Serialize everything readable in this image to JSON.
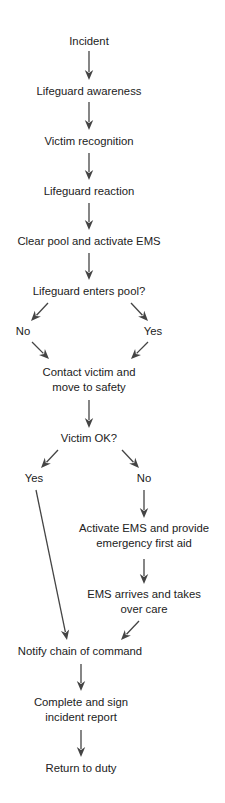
{
  "diagram": {
    "type": "flowchart",
    "colors": {
      "text": "#222222",
      "arrow": "#444444",
      "background": "#ffffff"
    },
    "nodes": [
      {
        "id": "incident",
        "lines": [
          "Incident"
        ],
        "x": 89,
        "y": 41
      },
      {
        "id": "awareness",
        "lines": [
          "Lifeguard awareness"
        ],
        "x": 89,
        "y": 91
      },
      {
        "id": "recognition",
        "lines": [
          "Victim recognition"
        ],
        "x": 89,
        "y": 141
      },
      {
        "id": "reaction",
        "lines": [
          "Lifeguard reaction"
        ],
        "x": 89,
        "y": 191
      },
      {
        "id": "clear_pool",
        "lines": [
          "Clear pool and activate EMS"
        ],
        "x": 89,
        "y": 241
      },
      {
        "id": "enters_pool",
        "lines": [
          "Lifeguard enters pool?"
        ],
        "x": 89,
        "y": 291
      },
      {
        "id": "enters_no",
        "lines": [
          "No"
        ],
        "x": 23,
        "y": 331
      },
      {
        "id": "enters_yes",
        "lines": [
          "Yes"
        ],
        "x": 153,
        "y": 331
      },
      {
        "id": "contact_victim",
        "lines": [
          "Contact victim and",
          "move to safety"
        ],
        "x": 89,
        "y": 379
      },
      {
        "id": "victim_ok",
        "lines": [
          "Victim OK?"
        ],
        "x": 89,
        "y": 438
      },
      {
        "id": "ok_yes",
        "lines": [
          "Yes"
        ],
        "x": 34,
        "y": 478
      },
      {
        "id": "ok_no",
        "lines": [
          "No"
        ],
        "x": 144,
        "y": 478
      },
      {
        "id": "activate_ems",
        "lines": [
          "Activate EMS and provide",
          "emergency first aid"
        ],
        "x": 144,
        "y": 535
      },
      {
        "id": "ems_arrives",
        "lines": [
          "EMS arrives and takes",
          "over care"
        ],
        "x": 144,
        "y": 601
      },
      {
        "id": "notify",
        "lines": [
          "Notify chain of command"
        ],
        "x": 80,
        "y": 651
      },
      {
        "id": "report",
        "lines": [
          "Complete and sign",
          "incident report"
        ],
        "x": 81,
        "y": 709
      },
      {
        "id": "return",
        "lines": [
          "Return to duty"
        ],
        "x": 81,
        "y": 768
      }
    ],
    "edges": [
      {
        "from": "incident",
        "to": "awareness",
        "x1": 89,
        "y1": 51,
        "x2": 89,
        "y2": 80
      },
      {
        "from": "awareness",
        "to": "recognition",
        "x1": 89,
        "y1": 102,
        "x2": 89,
        "y2": 130
      },
      {
        "from": "recognition",
        "to": "reaction",
        "x1": 89,
        "y1": 153,
        "x2": 89,
        "y2": 180
      },
      {
        "from": "reaction",
        "to": "clear_pool",
        "x1": 89,
        "y1": 203,
        "x2": 89,
        "y2": 230
      },
      {
        "from": "clear_pool",
        "to": "enters_pool",
        "x1": 89,
        "y1": 253,
        "x2": 89,
        "y2": 280
      },
      {
        "from": "enters_pool",
        "to": "enters_no",
        "x1": 48,
        "y1": 303,
        "x2": 31,
        "y2": 321
      },
      {
        "from": "enters_pool",
        "to": "enters_yes",
        "x1": 131,
        "y1": 303,
        "x2": 148,
        "y2": 321
      },
      {
        "from": "enters_no",
        "to": "contact_victim",
        "x1": 32,
        "y1": 342,
        "x2": 49,
        "y2": 359
      },
      {
        "from": "enters_yes",
        "to": "contact_victim",
        "x1": 148,
        "y1": 342,
        "x2": 131,
        "y2": 359
      },
      {
        "from": "contact_victim",
        "to": "victim_ok",
        "x1": 89,
        "y1": 400,
        "x2": 89,
        "y2": 428
      },
      {
        "from": "victim_ok",
        "to": "ok_yes",
        "x1": 58,
        "y1": 450,
        "x2": 41,
        "y2": 468
      },
      {
        "from": "victim_ok",
        "to": "ok_no",
        "x1": 122,
        "y1": 450,
        "x2": 139,
        "y2": 468
      },
      {
        "from": "ok_yes",
        "to": "notify",
        "x1": 36,
        "y1": 490,
        "x2": 67,
        "y2": 640
      },
      {
        "from": "ok_no",
        "to": "activate_ems",
        "x1": 144,
        "y1": 490,
        "x2": 144,
        "y2": 518
      },
      {
        "from": "activate_ems",
        "to": "ems_arrives",
        "x1": 144,
        "y1": 559,
        "x2": 144,
        "y2": 584
      },
      {
        "from": "ems_arrives",
        "to": "notify",
        "x1": 139,
        "y1": 621,
        "x2": 121,
        "y2": 640
      },
      {
        "from": "notify",
        "to": "report",
        "x1": 81,
        "y1": 664,
        "x2": 81,
        "y2": 691
      },
      {
        "from": "report",
        "to": "return",
        "x1": 81,
        "y1": 730,
        "x2": 81,
        "y2": 757
      }
    ]
  }
}
